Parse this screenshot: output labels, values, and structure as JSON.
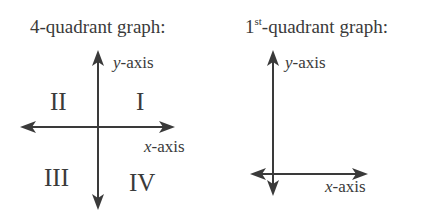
{
  "left_graph": {
    "title": "4-quadrant graph:",
    "y_axis_label_var": "y",
    "y_axis_label_rest": "-axis",
    "x_axis_label_var": "x",
    "x_axis_label_rest": "-axis",
    "quadrants": {
      "q1": "I",
      "q2": "II",
      "q3": "III",
      "q4": "IV"
    }
  },
  "right_graph": {
    "title_num": "1",
    "title_sup": "st",
    "title_rest": "-quadrant graph:",
    "y_axis_label_var": "y",
    "y_axis_label_rest": "-axis",
    "x_axis_label_var": "x",
    "x_axis_label_rest": "-axis"
  },
  "colors": {
    "ink": "#3a3a3a",
    "background": "#ffffff"
  }
}
